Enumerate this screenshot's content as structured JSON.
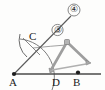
{
  "figure": {
    "background_color": "#fdfdfc",
    "ink_color": "#4a4a4a",
    "label_color": "#1a1a1a",
    "tool_color": "#9a9a9a",
    "points": [
      {
        "id": "A",
        "label": "A",
        "x": 14,
        "y": 74,
        "dot": true
      },
      {
        "id": "C",
        "label": "C",
        "x": 33,
        "y": 44,
        "dot": false
      },
      {
        "id": "D",
        "label": "D",
        "x": 56,
        "y": 74,
        "dot": false
      },
      {
        "id": "B",
        "label": "B",
        "x": 78,
        "y": 74,
        "dot": true
      }
    ],
    "callouts": [
      {
        "id": "3",
        "label": "③",
        "x": 57,
        "y": 33
      },
      {
        "id": "4",
        "label": "④",
        "x": 73,
        "y": 11
      }
    ],
    "baseline": {
      "from": "A",
      "to": "right-edge",
      "x1": 14,
      "y1": 74,
      "x2": 100,
      "y2": 74
    },
    "ray": {
      "from": "A",
      "through": "C",
      "to": "callout-4",
      "x1": 14,
      "y1": 74,
      "x2": 71,
      "y2": 16
    },
    "arc_main": {
      "center": "A",
      "radius": 38,
      "from_angle": 205,
      "to_angle": 300
    },
    "arc_cross": {
      "center": "D",
      "radius": 25,
      "note": "small arc crossing at C"
    },
    "compass": {
      "hinge_x": 67,
      "hinge_y": 42,
      "leg_left_x": 50,
      "leg_left_y": 70,
      "leg_right_x": 88,
      "leg_right_y": 62
    }
  }
}
